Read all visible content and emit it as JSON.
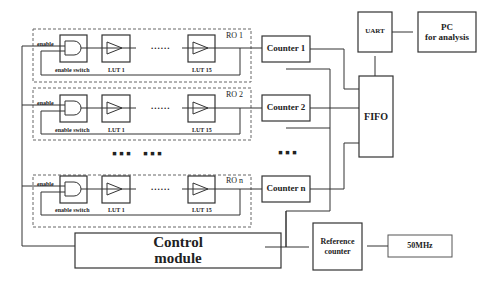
{
  "ring_oscillators": [
    {
      "label": "RO 1",
      "enable_label": "enable",
      "switch_label": "enable switch",
      "lut_first": "LUT 1",
      "lut_last": "LUT 15",
      "dots": "......"
    },
    {
      "label": "RO 2",
      "enable_label": "enable",
      "switch_label": "enable switch",
      "lut_first": "LUT 1",
      "lut_last": "LUT 15",
      "dots": "......"
    },
    {
      "label": "RO n",
      "enable_label": "enable",
      "switch_label": "enable switch",
      "lut_first": "LUT 1",
      "lut_last": "LUT 15",
      "dots": "......"
    }
  ],
  "counters": [
    {
      "label": "Counter 1"
    },
    {
      "label": "Counter 2"
    },
    {
      "label": "Counter n"
    }
  ],
  "ellipsis": {
    "ro_gap_1": "▪▪▪",
    "ro_gap_2": "▪▪▪",
    "counter_gap": "▪▪▪"
  },
  "blocks": {
    "uart": "UART",
    "pc_line1": "PC",
    "pc_line2": "for analysis",
    "fifo": "FIFO",
    "control_line1": "Control",
    "control_line2": "module",
    "reference_line1": "Reference",
    "reference_line2": "counter",
    "clock": "50MHz"
  }
}
